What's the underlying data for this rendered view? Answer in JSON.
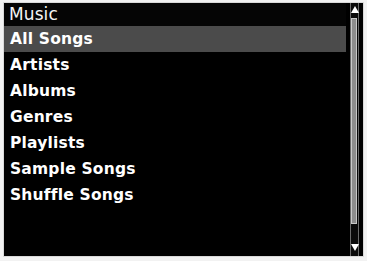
{
  "header": {
    "title": "Music"
  },
  "menu": {
    "items": [
      {
        "label": "All Songs",
        "selected": true
      },
      {
        "label": "Artists",
        "selected": false
      },
      {
        "label": "Albums",
        "selected": false
      },
      {
        "label": "Genres",
        "selected": false
      },
      {
        "label": "Playlists",
        "selected": false
      },
      {
        "label": "Sample Songs",
        "selected": false
      },
      {
        "label": "Shuffle Songs",
        "selected": false
      }
    ]
  },
  "scrollbar": {
    "up_arrow_icon": "triangle-up-icon",
    "down_arrow_icon": "triangle-down-icon"
  },
  "colors": {
    "background": "#000000",
    "titlebar": "#050505",
    "selection": "#4b4b4b",
    "text": "#ffffff",
    "frame": "#d9d9d9",
    "scroll_thumb": "#8d8d8d"
  }
}
